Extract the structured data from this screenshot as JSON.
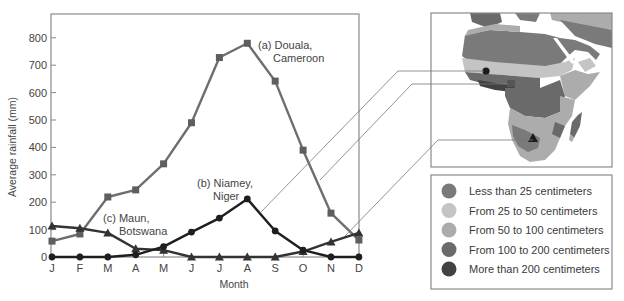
{
  "chart_data": {
    "type": "line",
    "title": "",
    "xlabel": "Month",
    "ylabel": "Average rainfall (mm)",
    "categories": [
      "J",
      "F",
      "M",
      "A",
      "M",
      "J",
      "J",
      "A",
      "S",
      "O",
      "N",
      "D"
    ],
    "ylim": [
      0,
      850
    ],
    "yticks": [
      0,
      100,
      200,
      300,
      400,
      500,
      600,
      700,
      800
    ],
    "grid": false,
    "series": [
      {
        "name": "(a) Douala, Cameroon",
        "marker": "square",
        "color": "#6e6e6e",
        "values": [
          58,
          84,
          219,
          245,
          340,
          490,
          728,
          780,
          642,
          390,
          160,
          62
        ]
      },
      {
        "name": "(b) Niamey, Niger",
        "marker": "circle",
        "color": "#1e1e1e",
        "values": [
          0,
          0,
          0,
          8,
          38,
          91,
          142,
          212,
          95,
          25,
          0,
          0
        ]
      },
      {
        "name": "(c) Maun, Botswana",
        "marker": "triangle",
        "color": "#333333",
        "values": [
          113,
          105,
          88,
          30,
          25,
          0,
          0,
          0,
          0,
          20,
          55,
          88
        ]
      }
    ],
    "annotations": [
      {
        "series": "(a) Douala, Cameroon",
        "lines": [
          "(a) Douala,",
          "Cameroon"
        ]
      },
      {
        "series": "(b) Niamey, Niger",
        "lines": [
          "(b) Niamey,",
          "Niger"
        ]
      },
      {
        "series": "(c) Maun, Botswana",
        "lines": [
          "(c) Maun,",
          "Botswana"
        ]
      }
    ]
  },
  "map": {
    "subject": "Africa annual precipitation",
    "markers": [
      {
        "name": "Niamey",
        "shape": "circle"
      },
      {
        "name": "Douala",
        "shape": "square"
      },
      {
        "name": "Maun",
        "shape": "triangle"
      }
    ]
  },
  "legend": {
    "items": [
      {
        "label": "Less than 25 centimeters",
        "color": "#7a7a7a"
      },
      {
        "label": "From 25 to 50 centimeters",
        "color": "#c4c4c4"
      },
      {
        "label": "From 50 to 100 centimeters",
        "color": "#acacac"
      },
      {
        "label": "From 100 to 200 centimeters",
        "color": "#6a6a6a"
      },
      {
        "label": "More than 200 centimeters",
        "color": "#424242"
      }
    ]
  }
}
